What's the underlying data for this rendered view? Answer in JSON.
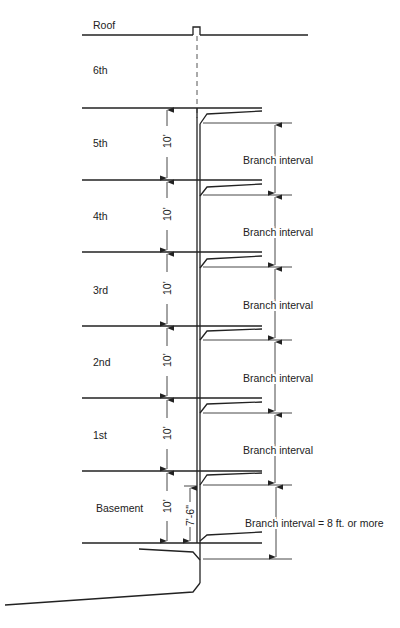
{
  "diagram": {
    "floors": [
      {
        "label": "Roof"
      },
      {
        "label": "6th"
      },
      {
        "label": "5th"
      },
      {
        "label": "4th"
      },
      {
        "label": "3rd"
      },
      {
        "label": "2nd"
      },
      {
        "label": "1st"
      },
      {
        "label": "Basement"
      }
    ],
    "floor_height_labels": [
      "10'",
      "10'",
      "10'",
      "10'",
      "10'",
      "10'"
    ],
    "basement_branch_height": "7'-6\"",
    "branch_interval_labels": [
      "Branch interval",
      "Branch interval",
      "Branch interval",
      "Branch interval",
      "Branch interval",
      "Branch interval = 8 ft. or more"
    ]
  }
}
